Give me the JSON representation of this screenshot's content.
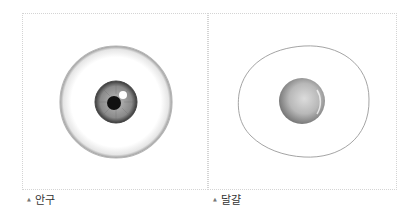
{
  "figures": [
    {
      "id": "eyeball",
      "caption": "안구",
      "marker": "▲"
    },
    {
      "id": "egg",
      "caption": "달걀",
      "marker": "▲"
    }
  ],
  "colors": {
    "border": "#d4d4d4",
    "caption_text": "#333333",
    "sclera_outline": "#8a8a8a",
    "iris": "#8c8c8c",
    "pupil": "#111111",
    "yolk": "#a9a9a9"
  }
}
